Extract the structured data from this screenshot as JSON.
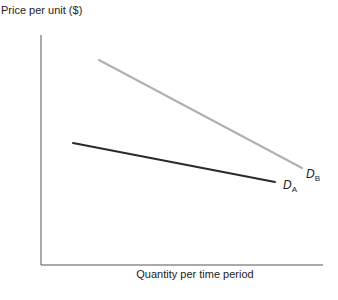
{
  "chart_data": {
    "type": "line",
    "title": "",
    "xlabel": "Quantity per time period",
    "ylabel": "Price per unit ($)",
    "grid": false,
    "legend": "inline labels at line ends",
    "series": [
      {
        "name": "D_A",
        "label_main": "D",
        "label_sub": "A",
        "color": "#2a2a2a",
        "points": [
          [
            73,
            143
          ],
          [
            275,
            182
          ]
        ]
      },
      {
        "name": "D_B",
        "label_main": "D",
        "label_sub": "B",
        "color": "#b0b0b0",
        "points": [
          [
            99,
            60
          ],
          [
            302,
            168
          ]
        ]
      }
    ],
    "axes": {
      "color": "#555555",
      "origin": [
        41,
        265
      ],
      "y_top": 35,
      "x_right": 323
    }
  }
}
